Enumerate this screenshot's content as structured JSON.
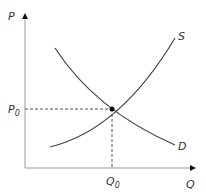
{
  "diagram": {
    "type": "supply-demand",
    "axes": {
      "y_label": "P",
      "x_label": "Q"
    },
    "curves": [
      {
        "name": "S",
        "label": "S"
      },
      {
        "name": "D",
        "label": "D"
      }
    ],
    "equilibrium": {
      "price_label": "P",
      "price_sub": "0",
      "quantity_label": "Q",
      "quantity_sub": "0"
    },
    "colors": {
      "axis": "#555555",
      "curve": "#444444",
      "guide": "#555555"
    }
  }
}
